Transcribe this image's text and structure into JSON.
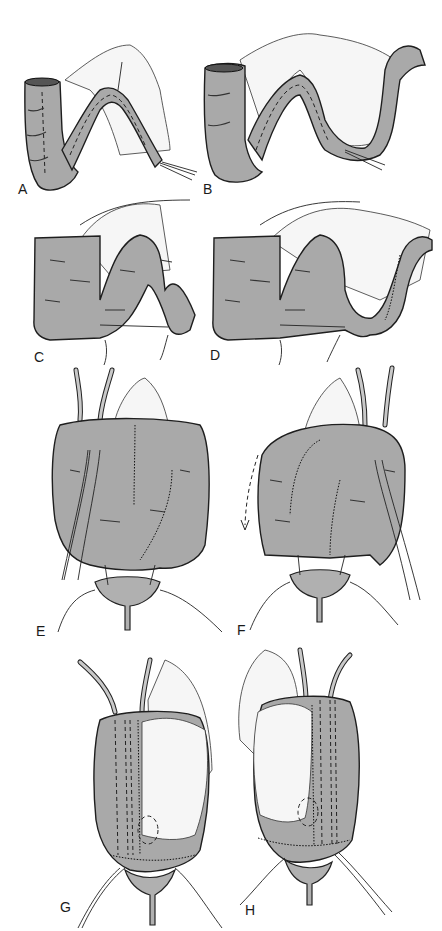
{
  "figure": {
    "type": "surgical illustration",
    "panels": [
      {
        "id": "A",
        "label": "A"
      },
      {
        "id": "B",
        "label": "B"
      },
      {
        "id": "C",
        "label": "C"
      },
      {
        "id": "D",
        "label": "D"
      },
      {
        "id": "E",
        "label": "E"
      },
      {
        "id": "F",
        "label": "F"
      },
      {
        "id": "G",
        "label": "G"
      },
      {
        "id": "H",
        "label": "H"
      }
    ]
  },
  "colors": {
    "tissue": "#a9a9a9",
    "outline": "#1e1e1e",
    "mesentery": "#f6f6f6",
    "background": "#ffffff"
  }
}
